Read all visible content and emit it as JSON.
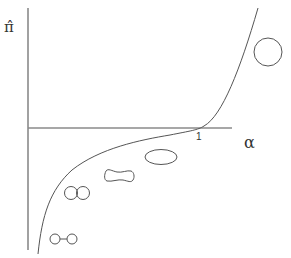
{
  "diagram": {
    "y_axis_label": "π̂",
    "x_axis_label": "α",
    "tick_label": "1",
    "colors": {
      "axis": "#808080",
      "curve": "#555555",
      "shapes": "#555555"
    },
    "shapes": [
      {
        "name": "two-small-circles-connected",
        "description": "two small circles joined by a line"
      },
      {
        "name": "two-touching-circles",
        "description": "two overlapping circles"
      },
      {
        "name": "peanut-shape",
        "description": "dumbbell / peanut shaped outline"
      },
      {
        "name": "ellipse",
        "description": "horizontal ellipse"
      },
      {
        "name": "large-circle",
        "description": "single large circle"
      }
    ]
  }
}
